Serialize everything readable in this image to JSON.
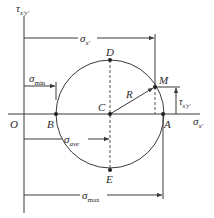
{
  "diagram": {
    "axes": {
      "vertical_label": "τ",
      "vertical_subscript": "x′y′",
      "horizontal_label": "σ",
      "horizontal_subscript": "x′",
      "origin_label": "O"
    },
    "points": {
      "A": "A",
      "B": "B",
      "C": "C",
      "D": "D",
      "E": "E",
      "M": "M"
    },
    "radius_label": "R",
    "dimensions": {
      "sigma_x": {
        "symbol": "σ",
        "subscript": "x′"
      },
      "sigma_min": {
        "symbol": "σ",
        "subscript": "min"
      },
      "sigma_ave": {
        "symbol": "σ",
        "subscript": "ave"
      },
      "sigma_max": {
        "symbol": "σ",
        "subscript": "max"
      },
      "tau_xy": {
        "symbol": "τ",
        "subscript": "x′y′"
      }
    },
    "colors": {
      "stroke": "#3a3a3a",
      "text": "#2a2a2a",
      "background": "#ffffff"
    }
  }
}
